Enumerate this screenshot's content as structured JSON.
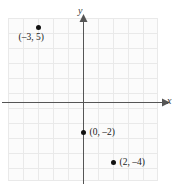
{
  "figure": {
    "kind": "coordinate-plane-scatter",
    "width": 178,
    "height": 191
  },
  "axes": {
    "x_label": "x",
    "y_label": "y",
    "x_axis_color": "#555555",
    "y_axis_color": "#555555",
    "grid_color": "#e9e9e9",
    "grid_on": true,
    "plot_background": "#fbfbfb"
  },
  "chart_data": {
    "type": "scatter",
    "title": "",
    "xlabel": "x",
    "ylabel": "y",
    "xlim": [
      -5,
      5
    ],
    "ylim": [
      -6,
      5
    ],
    "grid": true,
    "grid_step": 1,
    "legend": "none",
    "point_color": "#111111",
    "points": [
      {
        "x": -3,
        "y": 5,
        "label": "(–3, 5)",
        "label_position": "below-left"
      },
      {
        "x": 0,
        "y": -2,
        "label": "(0, –2)",
        "label_position": "right"
      },
      {
        "x": 2,
        "y": -4,
        "label": "(2, –4)",
        "label_position": "right"
      }
    ],
    "labels": [
      "(–3, 5)",
      "(0, –2)",
      "(2, –4)"
    ],
    "x_values": [
      -3,
      0,
      2
    ],
    "y_values": [
      5,
      -2,
      -4
    ],
    "tick_labels_shown": false,
    "axis_arrows": [
      "x-positive",
      "y-positive"
    ]
  }
}
